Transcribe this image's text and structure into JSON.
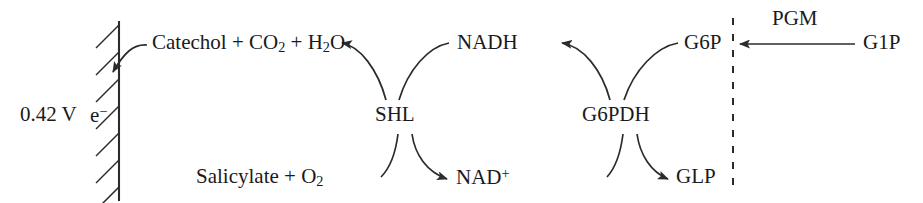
{
  "diagram": {
    "type": "biochemical-reaction-scheme",
    "background_color": "#ffffff",
    "stroke_color": "#2b2b2b",
    "text_color": "#1a1a1a",
    "electrode": {
      "name": "working-electrode",
      "potential_label": "0.42 V",
      "carrier_label_text": "e",
      "carrier_label_charge": "−"
    },
    "labels": {
      "catechol_products": "Catechol + CO",
      "catechol_sub1": "2",
      "catechol_mid": " + H",
      "catechol_sub2": "2",
      "catechol_end": "O",
      "substrate": "Salicylate + O",
      "substrate_sub": "2",
      "nadh": "NADH",
      "nad_plus_base": "NAD",
      "nad_plus_sup": "+",
      "g6p": "G6P",
      "glp": "GLP",
      "g1p": "G1P"
    },
    "enzymes": {
      "shl": "SHL",
      "g6pdh": "G6PDH",
      "pgm": "PGM"
    },
    "divider": {
      "name": "dashed-compartment-divider",
      "style": "dashed-vertical"
    }
  }
}
